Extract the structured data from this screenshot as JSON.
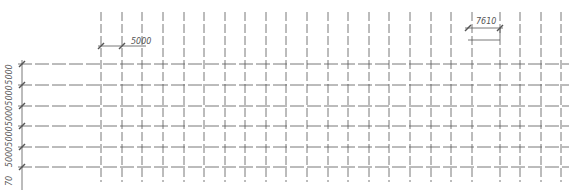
{
  "drawing": {
    "type": "structural-grid-plan",
    "line_color": "#555555",
    "text_color": "#555555",
    "background": "#ffffff",
    "vertical_grid_x": [
      101,
      122,
      142,
      163,
      184,
      204,
      225,
      245,
      266,
      286,
      307,
      328,
      348,
      369,
      389,
      410,
      431,
      451,
      472,
      500,
      520,
      541,
      561
    ],
    "horizontal_grid_y": [
      64,
      85,
      106,
      126,
      147,
      167
    ],
    "vertical_line_span": [
      12,
      182
    ],
    "horizontal_line_span": [
      18,
      569
    ],
    "dimensions": {
      "top_left": {
        "label": "5000",
        "x1": 101,
        "x2": 122,
        "y": 46,
        "label_x": 131,
        "label_y": 44
      },
      "top_right": {
        "label": "7610",
        "x1": 468,
        "x2": 500,
        "y": 28,
        "label_x": 476,
        "label_y": 24,
        "extra_line_y": 40
      },
      "left": {
        "x": 22,
        "labels": [
          "5000",
          "5000",
          "5000",
          "5000",
          "5000",
          "70"
        ],
        "label_x": 12
      }
    }
  }
}
